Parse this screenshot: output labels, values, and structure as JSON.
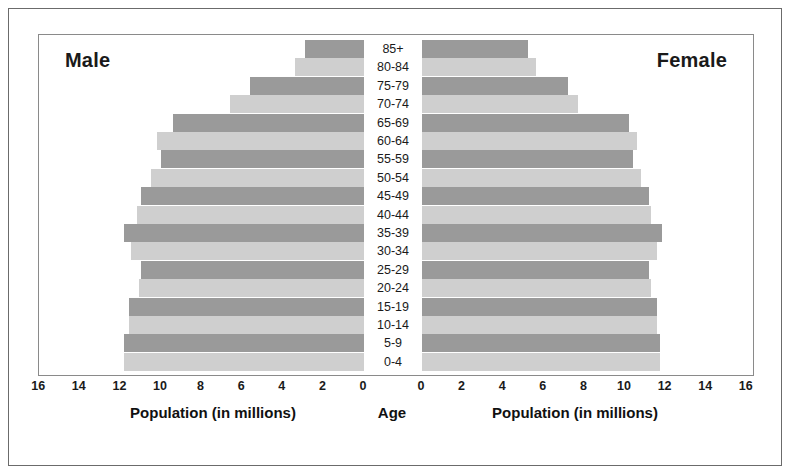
{
  "figure": {
    "male_caption": "Male",
    "female_caption": "Female",
    "age_axis_caption": "Age",
    "male_axis_caption": "Population (in millions)",
    "female_axis_caption": "Population (in millions)"
  },
  "colors": {
    "bar_dark": "#9a9a9a",
    "bar_light": "#cfcfcf",
    "frame": "#8a8a8a",
    "outer_border": "#6b6b6b",
    "text": "#1a1a1a",
    "background": "#ffffff"
  },
  "chart_data": {
    "type": "bar",
    "subtype": "population-pyramid",
    "title": "",
    "xlabel": "Population (in millions)",
    "ylabel": "Age",
    "categories": [
      "85+",
      "80-84",
      "75-79",
      "70-74",
      "65-69",
      "60-64",
      "55-59",
      "50-54",
      "45-49",
      "40-44",
      "35-39",
      "30-34",
      "25-29",
      "20-24",
      "15-19",
      "10-14",
      "5-9",
      "0-4"
    ],
    "xlim": [
      0,
      16
    ],
    "xticks": [
      0,
      2,
      4,
      6,
      8,
      10,
      12,
      14,
      16
    ],
    "left_axis_ticks": [
      16,
      14,
      12,
      10,
      8,
      6,
      4,
      2,
      0
    ],
    "right_axis_ticks": [
      0,
      2,
      4,
      6,
      8,
      10,
      12,
      14,
      16
    ],
    "grid": false,
    "legend": "none",
    "series": [
      {
        "name": "Male",
        "side": "left",
        "values": [
          2.9,
          3.4,
          5.6,
          6.6,
          9.4,
          10.2,
          10.0,
          10.5,
          11.0,
          11.2,
          11.8,
          11.5,
          11.0,
          11.1,
          11.6,
          11.6,
          11.8,
          11.8
        ]
      },
      {
        "name": "Female",
        "side": "right",
        "values": [
          5.2,
          5.6,
          7.2,
          7.7,
          10.2,
          10.6,
          10.4,
          10.8,
          11.2,
          11.3,
          11.8,
          11.6,
          11.2,
          11.3,
          11.6,
          11.6,
          11.7,
          11.7
        ]
      }
    ],
    "bar_shades": [
      "dark",
      "light",
      "dark",
      "light",
      "dark",
      "light",
      "dark",
      "light",
      "dark",
      "light",
      "dark",
      "light",
      "dark",
      "light",
      "dark",
      "light",
      "dark",
      "light"
    ]
  }
}
